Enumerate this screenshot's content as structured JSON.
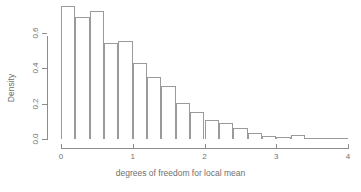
{
  "chart_data": {
    "type": "bar",
    "title": "",
    "subtitle": "",
    "xlabel": "degrees of freedom for local mean",
    "ylabel": "Density",
    "xlim": [
      0,
      4
    ],
    "ylim": [
      0,
      0.75
    ],
    "grid": false,
    "legend": null,
    "bin_width": 0.2,
    "x_ticks": [
      0,
      1,
      2,
      3,
      4
    ],
    "x_tick_labels": [
      "0",
      "1",
      "2",
      "3",
      "4"
    ],
    "y_ticks": [
      0.0,
      0.2,
      0.4,
      0.6
    ],
    "y_tick_labels": [
      "0.0",
      "0.2",
      "0.4",
      "0.6"
    ],
    "bin_edges": [
      0.0,
      0.2,
      0.4,
      0.6,
      0.8,
      1.0,
      1.2,
      1.4,
      1.6,
      1.8,
      2.0,
      2.2,
      2.4,
      2.6,
      2.8,
      3.0,
      3.2,
      3.4,
      3.6,
      3.8,
      4.0
    ],
    "categories": [
      "0.0-0.2",
      "0.2-0.4",
      "0.4-0.6",
      "0.6-0.8",
      "0.8-1.0",
      "1.0-1.2",
      "1.2-1.4",
      "1.4-1.6",
      "1.6-1.8",
      "1.8-2.0",
      "2.0-2.2",
      "2.2-2.4",
      "2.4-2.6",
      "2.6-2.8",
      "2.8-3.0",
      "3.0-3.2",
      "3.2-3.4",
      "3.4-3.6",
      "3.6-3.8",
      "3.8-4.0"
    ],
    "values": [
      0.75,
      0.69,
      0.72,
      0.54,
      0.55,
      0.43,
      0.35,
      0.3,
      0.205,
      0.15,
      0.105,
      0.09,
      0.06,
      0.035,
      0.015,
      0.01,
      0.02,
      0.008,
      0.0,
      0.006
    ]
  },
  "axis_colors": {
    "line": "#8c8c8c",
    "bar_outline": "#9a9a9a",
    "text": "#6f6f6f",
    "background": "#ffffff"
  }
}
